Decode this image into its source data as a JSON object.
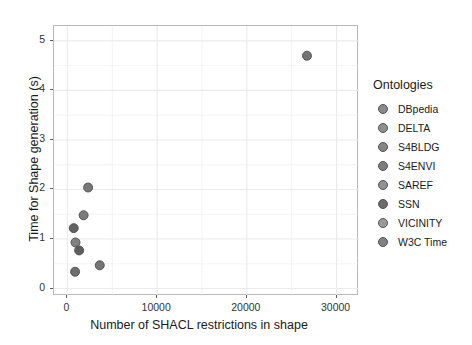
{
  "chart_data": {
    "type": "scatter",
    "title": "",
    "xlabel": "Number of SHACL restrictions in shape",
    "ylabel": "Time for Shape generation (s)",
    "xlim": [
      -1500,
      32500
    ],
    "ylim": [
      -0.15,
      5.3
    ],
    "xticks": [
      0,
      10000,
      20000,
      30000
    ],
    "xtick_labels": [
      "0",
      "10000",
      "20000",
      "30000"
    ],
    "yticks": [
      0,
      1,
      2,
      3,
      4,
      5
    ],
    "ytick_labels": [
      "0",
      "1",
      "2",
      "3",
      "4",
      "5"
    ],
    "grid": true,
    "grid_color": "#ebebeb",
    "panel_background": "#ffffff",
    "panel_border_color": "#b9b9b9",
    "legend_position": "right",
    "legend_title": "Ontologies",
    "marker": "circle",
    "marker_size": 9,
    "points": [
      {
        "name": "DBpedia",
        "x": 26700,
        "y": 4.7,
        "color": "#737373"
      },
      {
        "name": "DELTA",
        "x": 2300,
        "y": 2.04,
        "color": "#777777"
      },
      {
        "name": "S4BLDG",
        "x": 1800,
        "y": 1.48,
        "color": "#7b7b7b"
      },
      {
        "name": "S4ENVI",
        "x": 700,
        "y": 1.22,
        "color": "#636363"
      },
      {
        "name": "SAREF",
        "x": 900,
        "y": 0.93,
        "color": "#818181"
      },
      {
        "name": "SSN",
        "x": 1300,
        "y": 0.77,
        "color": "#5e5e5e"
      },
      {
        "name": "VICINITY",
        "x": 3600,
        "y": 0.47,
        "color": "#767676"
      },
      {
        "name": "W3C Time",
        "x": 850,
        "y": 0.34,
        "color": "#6e6e6e"
      }
    ],
    "legend_entries": [
      {
        "label": "DBpedia",
        "color": "#8a8a8a"
      },
      {
        "label": "DELTA",
        "color": "#8f8f8f"
      },
      {
        "label": "S4BLDG",
        "color": "#858585"
      },
      {
        "label": "S4ENVI",
        "color": "#7d7d7d"
      },
      {
        "label": "SAREF",
        "color": "#929292"
      },
      {
        "label": "SSN",
        "color": "#6b6b6b"
      },
      {
        "label": "VICINITY",
        "color": "#9a9a9a"
      },
      {
        "label": "W3C Time",
        "color": "#828282"
      }
    ]
  }
}
